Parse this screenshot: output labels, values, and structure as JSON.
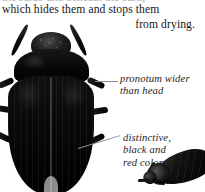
{
  "page": {
    "background_color": "#ffffff",
    "ink_color": "#151515"
  },
  "body_text": {
    "cut_off_line_above": "the scrub and beneath the bark,",
    "line_1": "which hides them and stops them",
    "line_2": "from drying."
  },
  "illustration": {
    "main_specimen": {
      "name": "beetle-dorsal-view",
      "parts": {
        "antenna_left": "antenna",
        "antenna_right": "antenna",
        "head": "head",
        "pronotum": "pronotum",
        "elytra": "elytra",
        "legs": [
          "leg",
          "leg",
          "leg",
          "leg",
          "leg",
          "leg"
        ]
      },
      "color": "#000000"
    },
    "secondary_specimen": {
      "name": "beetle-angled-view",
      "color": "#111111"
    }
  },
  "annotations": [
    {
      "id": "pronotum",
      "lines": [
        "pronotum wider",
        "than head"
      ],
      "leader": "horizontal-leader-line"
    },
    {
      "id": "coloration",
      "lines": [
        "distinctive,",
        "black and",
        "red coloration"
      ],
      "leader": "diagonal-leader-line"
    }
  ],
  "colors": {
    "specimen_black": "#000000",
    "leader_grey": "#8c8c8c",
    "text_black": "#1c1c1c"
  }
}
